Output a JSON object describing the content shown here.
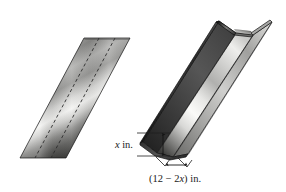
{
  "figure": {
    "background_color": "#ffffff",
    "width": 286,
    "height": 192,
    "panels": [
      {
        "id": "flat-sheet",
        "name": "flat-sheet-panel",
        "description": "Flat rectangular sheet of metal drawn in perspective as a parallelogram with two dashed fold lines",
        "fold_line_count": 2,
        "fold_line_style": "dashed"
      },
      {
        "id": "folded-gutter",
        "name": "folded-gutter-panel",
        "description": "The same sheet folded up along the dashed lines to form an open U-shaped gutter",
        "cross_section": "U-shape"
      }
    ],
    "dimensions": [
      {
        "id": "height",
        "name": "height-dimension",
        "label": "x in.",
        "variable": "x",
        "unit": "in.",
        "orientation": "vertical",
        "arrow": "double-headed",
        "measures": "turned-up side height of the gutter"
      },
      {
        "id": "width",
        "name": "width-dimension",
        "label": "(12 − 2x) in.",
        "expression": "(12 − 2x)",
        "unit": "in.",
        "orientation": "horizontal",
        "arrow": "double-headed",
        "measures": "width of the flat bottom of the gutter"
      }
    ],
    "label_parts": {
      "height_var": "x",
      "height_unit": "in.",
      "width_open_paren": "(",
      "width_constant": "12",
      "width_minus": "−",
      "width_coefficient": "2",
      "width_var": "x",
      "width_close_paren": ")",
      "width_unit": "in."
    },
    "colors": {
      "metal_light": "#f2f2f0",
      "metal_mid": "#9a9a98",
      "metal_dark": "#2a2a2a",
      "metal_darkest": "#141414",
      "outline": "#111111",
      "fold_dash": "#2b2b2b",
      "text": "#1a1a1a",
      "background": "#ffffff"
    }
  }
}
